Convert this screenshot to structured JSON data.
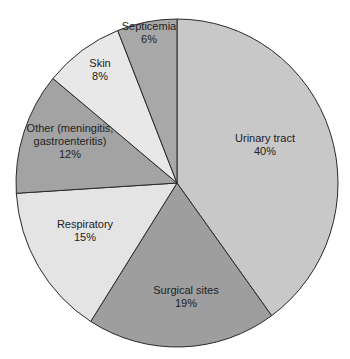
{
  "chart_data": {
    "type": "pie",
    "title": "",
    "categories": [
      "Urinary tract",
      "Surgical sites",
      "Respiratory",
      "Other (meningitis, gastroenteritis)",
      "Skin",
      "Septicemia"
    ],
    "values": [
      40,
      19,
      15,
      12,
      8,
      6
    ],
    "unit": "%",
    "start_angle_deg": 0,
    "direction": "clockwise",
    "legend": "none",
    "slices": [
      {
        "name": "Urinary tract",
        "value": 40,
        "label_lines": [
          "Urinary tract",
          "40%"
        ],
        "color": "#c8c8c8",
        "label_pos": [
          265,
          148
        ]
      },
      {
        "name": "Surgical sites",
        "value": 19,
        "label_lines": [
          "Surgical sites",
          "19%"
        ],
        "color": "#9e9e9e",
        "label_pos": [
          186,
          300
        ]
      },
      {
        "name": "Respiratory",
        "value": 15,
        "label_lines": [
          "Respiratory",
          "15%"
        ],
        "color": "#e4e4e4",
        "label_pos": [
          85,
          234
        ]
      },
      {
        "name": "Other (meningitis, gastroenteritis)",
        "value": 12,
        "label_lines": [
          "Other (meningitis,",
          "gastroenteritis)",
          "12%"
        ],
        "color": "#a3a3a3",
        "label_pos": [
          70,
          145
        ]
      },
      {
        "name": "Skin",
        "value": 8,
        "label_lines": [
          "Skin",
          "8%"
        ],
        "color": "#e8e8e8",
        "label_pos": [
          100,
          73
        ]
      },
      {
        "name": "Septicemia",
        "value": 6,
        "label_lines": [
          "Septicemia",
          "6%"
        ],
        "color": "#a8a8a8",
        "label_pos": [
          149,
          36
        ]
      }
    ]
  }
}
